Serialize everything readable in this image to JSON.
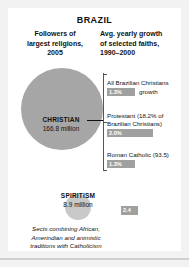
{
  "title": "BRAZIL",
  "columns": {
    "left_heading": "Followers of\nlargest religions,\n2005",
    "right_heading": "Avg. yearly growth\nof selected faiths,\n1990–2000"
  },
  "pie": {
    "christian": {
      "name": "CHRISTIAN",
      "value": "166.8 million"
    },
    "spiritism": {
      "name": "SPIRITISM",
      "value": "8.9 million"
    }
  },
  "growth": [
    {
      "label": "All Brazilian Christians",
      "value": "1.3%",
      "suffix": "growth"
    },
    {
      "label": "Protestant (18.2% of\nBrazilian Christians)",
      "value": "2.0%",
      "suffix": ""
    },
    {
      "label": "Roman Catholic (93.5)",
      "value": "1.3%",
      "suffix": ""
    }
  ],
  "spiritism_bar": {
    "value": "2.4"
  },
  "footnote": "Sects combining African,\nAmerindian and animistic\ntraditions with Catholicism",
  "colors": {
    "pie_main": "#a6a6a6",
    "pie_small": "#c9c9c9",
    "bar": "#a0a0a0",
    "page_bg": "#f2f2f2",
    "panel_bg": "#ffffff",
    "text": "#111111"
  }
}
